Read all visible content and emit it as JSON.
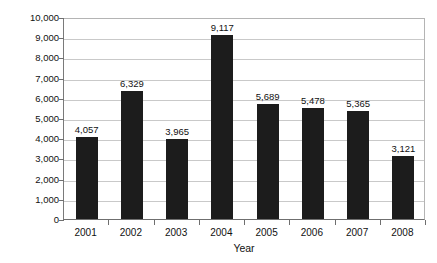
{
  "chart_data": {
    "type": "bar",
    "title": "",
    "subtitle": "",
    "xlabel": "Year",
    "ylabel": "Number of Children",
    "categories": [
      "2001",
      "2002",
      "2003",
      "2004",
      "2005",
      "2006",
      "2007",
      "2008"
    ],
    "values": [
      4057,
      6329,
      3965,
      9117,
      5689,
      5478,
      5365,
      3121
    ],
    "value_labels": [
      "4,057",
      "6,329",
      "3,965",
      "9,117",
      "5,689",
      "5,478",
      "5,365",
      "3,121"
    ],
    "ylim": [
      0,
      10000
    ],
    "ytick_values": [
      10000,
      9000,
      8000,
      7000,
      6000,
      5000,
      4000,
      3000,
      2000,
      1000,
      0
    ],
    "ytick_labels": [
      "10,000",
      "9,000",
      "8,000",
      "7,000",
      "6,000",
      "5,000",
      "4,000",
      "3,000",
      "2,000",
      "1,000",
      "0"
    ],
    "grid": true,
    "grid_axis": "y",
    "legend": false,
    "legend_position": "none",
    "series": [
      {
        "name": "Number of Children",
        "values": [
          4057,
          6329,
          3965,
          9117,
          5689,
          5478,
          5365,
          3121
        ],
        "color": "#1c1c1c"
      }
    ],
    "bar_color": "#1c1c1c",
    "gridline_color": "#c9c9c9",
    "axis_color": "#6f6f6f",
    "background_color": "#ffffff",
    "data_labels_shown": true
  }
}
